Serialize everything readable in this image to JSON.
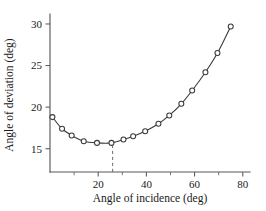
{
  "chart_data": {
    "type": "line",
    "title": "",
    "subtitle": "",
    "xlabel": "Angle of incidence (deg)",
    "ylabel": "Angle of deviation (deg)",
    "xlim": [
      0,
      83
    ],
    "ylim": [
      12.2,
      31.2
    ],
    "xticks": [
      20,
      40,
      60,
      80
    ],
    "xticklabels": [
      "20",
      "40",
      "60",
      "80"
    ],
    "xminorticks": [
      10,
      30,
      50,
      70
    ],
    "yticks": [
      15,
      20,
      25,
      30
    ],
    "yticklabels": [
      "15",
      "20",
      "25",
      "30"
    ],
    "grid": false,
    "legend": null,
    "markers": "open-circle",
    "series": [
      {
        "name": "angle of deviation",
        "x": [
          1.0,
          5.0,
          9.0,
          14.0,
          19.5,
          25.5,
          30.5,
          34.5,
          39.5,
          45.0,
          49.5,
          54.5,
          59.0,
          64.5,
          69.5,
          75.0
        ],
        "values": [
          18.8,
          17.4,
          16.6,
          15.9,
          15.7,
          15.7,
          16.1,
          16.5,
          17.1,
          18.0,
          19.0,
          20.4,
          22.0,
          24.2,
          26.5,
          29.7
        ]
      }
    ],
    "annotations": [
      {
        "name": "minimum-deviation-guide",
        "type": "vertical-dashed-line",
        "x": 26.0,
        "y_from": 12.2,
        "y_to": 15.7
      }
    ]
  },
  "axes": {
    "x_axis_name": "x-axis",
    "y_axis_name": "y-axis"
  }
}
